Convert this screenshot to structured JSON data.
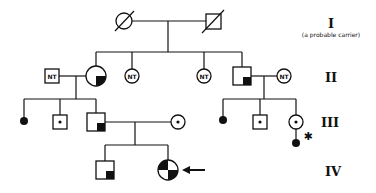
{
  "diagram": {
    "type": "pedigree",
    "generations": [
      {
        "label": "I",
        "note": "(a probable carrier)"
      },
      {
        "label": "II"
      },
      {
        "label": "III"
      },
      {
        "label": "IV"
      }
    ],
    "nt_label": "NT",
    "proband_marker": "arrow",
    "asterisk": "✱"
  }
}
